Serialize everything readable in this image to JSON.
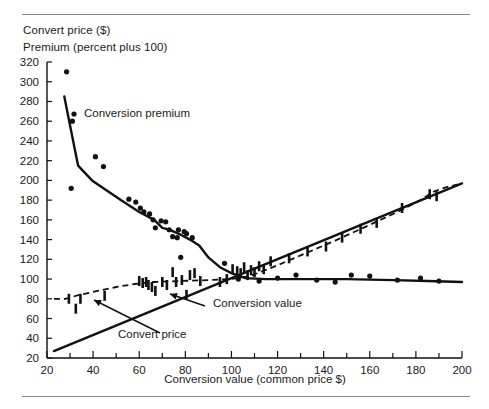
{
  "figure": {
    "y_axis_titles": [
      "Convert price ($)",
      "Premium (percent plus 100)"
    ],
    "x_axis_title": "Conversion value (common price $)",
    "rule_color": "#8d8d8d",
    "ink_color": "#111111"
  },
  "annotations": [
    {
      "name": "conversion-premium",
      "text": "Conversion premium",
      "x": 84,
      "y": 117
    },
    {
      "name": "conversion-value",
      "text": "Conversion value",
      "x": 213,
      "y": 307
    },
    {
      "name": "convert-price",
      "text": "Convert price",
      "x": 118,
      "y": 338
    }
  ],
  "chart_data": {
    "type": "scatter",
    "title": "",
    "subtitle": "",
    "xlabel": "Conversion value (common price $)",
    "ylabel": "Convert price ($) / Premium (percent plus 100)",
    "xlim": [
      20,
      200
    ],
    "ylim": [
      20,
      320
    ],
    "xticks": [
      20,
      40,
      60,
      80,
      100,
      120,
      140,
      160,
      180,
      200
    ],
    "yticks": [
      20,
      40,
      60,
      80,
      100,
      120,
      140,
      160,
      180,
      200,
      220,
      240,
      260,
      280,
      300,
      320
    ],
    "x_minor_step": 10,
    "grid": false,
    "legend": "inline-annotations",
    "series": [
      {
        "name": "Conversion premium",
        "kind": "scatter-dots",
        "marker": "filled-circle",
        "points": [
          [
            28.5,
            310
          ],
          [
            31.0,
            260
          ],
          [
            30.5,
            192
          ],
          [
            41.0,
            224
          ],
          [
            44.5,
            214
          ],
          [
            55.5,
            181
          ],
          [
            58.5,
            178
          ],
          [
            60.5,
            172
          ],
          [
            62.0,
            168
          ],
          [
            64.5,
            166
          ],
          [
            66.0,
            160
          ],
          [
            69.5,
            159
          ],
          [
            71.5,
            158
          ],
          [
            67.0,
            152
          ],
          [
            73.0,
            150
          ],
          [
            77.0,
            150
          ],
          [
            79.5,
            148
          ],
          [
            80.5,
            146
          ],
          [
            74.5,
            143
          ],
          [
            76.5,
            142
          ],
          [
            83.0,
            142
          ],
          [
            78.0,
            122
          ],
          [
            97.0,
            116
          ]
        ]
      },
      {
        "name": "Conversion premium curve",
        "kind": "line-solid",
        "points": [
          [
            27.5,
            285
          ],
          [
            32.0,
            232
          ],
          [
            33.5,
            215
          ],
          [
            39.5,
            200
          ],
          [
            52.0,
            180
          ],
          [
            60.0,
            168
          ],
          [
            66.5,
            160
          ],
          [
            70.0,
            152
          ],
          [
            73.0,
            150
          ],
          [
            78.0,
            145
          ],
          [
            82.0,
            140
          ],
          [
            86.0,
            134
          ],
          [
            90.0,
            122
          ],
          [
            95.0,
            112
          ],
          [
            100.0,
            106
          ],
          [
            106.0,
            101
          ],
          [
            115.0,
            100
          ],
          [
            130.0,
            100
          ],
          [
            150.0,
            100
          ],
          [
            170.0,
            99
          ],
          [
            185.0,
            98
          ],
          [
            200.0,
            97
          ]
        ]
      },
      {
        "name": "Convert price",
        "kind": "line-dashed",
        "points": [
          [
            23.0,
            80
          ],
          [
            28.0,
            80
          ],
          [
            34.0,
            84
          ],
          [
            42.0,
            88
          ],
          [
            50.0,
            92
          ],
          [
            58.0,
            95
          ],
          [
            66.0,
            97
          ],
          [
            78.0,
            98
          ],
          [
            90.0,
            99
          ],
          [
            100.0,
            100
          ],
          [
            108.0,
            103
          ],
          [
            118.0,
            112
          ],
          [
            130.0,
            124
          ],
          [
            145.0,
            139
          ],
          [
            160.0,
            155
          ],
          [
            172.0,
            168
          ],
          [
            182.0,
            180
          ],
          [
            188.0,
            189
          ],
          [
            193.0,
            193
          ],
          [
            200.0,
            197
          ]
        ]
      },
      {
        "name": "Conversion value",
        "kind": "line-solid-straight",
        "points": [
          [
            23.0,
            27
          ],
          [
            200.0,
            197
          ]
        ]
      },
      {
        "name": "Convert price observations",
        "kind": "vertical-bar-marks",
        "points": [
          [
            29.5,
            80
          ],
          [
            32.5,
            70
          ],
          [
            34.5,
            80
          ],
          [
            45.0,
            83
          ],
          [
            60.0,
            98
          ],
          [
            61.5,
            96
          ],
          [
            63.0,
            97
          ],
          [
            64.0,
            94
          ],
          [
            65.5,
            92
          ],
          [
            67.0,
            88
          ],
          [
            70.0,
            97
          ],
          [
            72.0,
            94
          ],
          [
            74.5,
            107
          ],
          [
            76.0,
            97
          ],
          [
            78.5,
            99
          ],
          [
            80.5,
            84
          ],
          [
            82.0,
            104
          ],
          [
            84.0,
            106
          ],
          [
            86.5,
            98
          ],
          [
            95.0,
            97
          ],
          [
            98.0,
            100
          ],
          [
            100.5,
            110
          ],
          [
            102.5,
            108
          ],
          [
            104.0,
            106
          ],
          [
            105.5,
            112
          ],
          [
            107.0,
            104
          ],
          [
            108.5,
            109
          ],
          [
            110.0,
            107
          ],
          [
            112.0,
            113
          ],
          [
            114.0,
            110
          ],
          [
            117.0,
            118
          ],
          [
            125.0,
            121
          ],
          [
            133.0,
            128
          ],
          [
            141.0,
            133
          ],
          [
            148.0,
            142
          ],
          [
            156.0,
            151
          ],
          [
            163.0,
            157
          ],
          [
            174.0,
            172
          ],
          [
            186.0,
            186
          ],
          [
            189.0,
            184
          ]
        ]
      },
      {
        "name": "Conversion value observations",
        "kind": "scatter-dots-low",
        "marker": "filled-circle",
        "points": [
          [
            103.0,
            100
          ],
          [
            112.0,
            98
          ],
          [
            120.0,
            101
          ],
          [
            128.0,
            104
          ],
          [
            137.0,
            99
          ],
          [
            145.0,
            97
          ],
          [
            152.0,
            104
          ],
          [
            160.0,
            103
          ],
          [
            172.0,
            99
          ],
          [
            182.0,
            101
          ],
          [
            190.0,
            98
          ]
        ]
      }
    ]
  }
}
